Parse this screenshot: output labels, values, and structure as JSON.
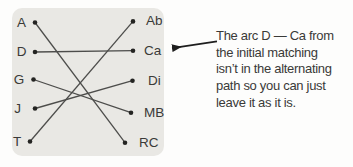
{
  "graph": {
    "left_nodes": [
      "A",
      "D",
      "G",
      "J",
      "T"
    ],
    "right_nodes": [
      "Ab",
      "Ca",
      "Di",
      "MB",
      "RC"
    ],
    "edges": [
      {
        "from": "A",
        "to": "RC"
      },
      {
        "from": "D",
        "to": "Ca"
      },
      {
        "from": "G",
        "to": "MB"
      },
      {
        "from": "J",
        "to": "Di"
      },
      {
        "from": "T",
        "to": "Ab"
      }
    ]
  },
  "annotation": {
    "lines": [
      "The arc D — Ca from",
      "the initial matching",
      "isn’t in the alternating",
      "path so you can just",
      "leave it as it is."
    ]
  },
  "colors": {
    "panel_bg": "#e9e8e4",
    "edge": "#4d4d4b",
    "dot": "#242422",
    "text": "#3a3a38",
    "arrow": "#1e1e1e"
  }
}
